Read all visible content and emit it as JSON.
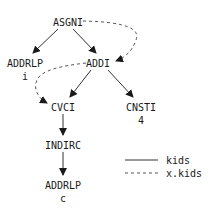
{
  "diagram": {
    "nodes": [
      {
        "id": "asgni",
        "label": "ASGNI",
        "sub": ""
      },
      {
        "id": "addrlp-i",
        "label": "ADDRLP",
        "sub": "i"
      },
      {
        "id": "addi",
        "label": "ADDI",
        "sub": ""
      },
      {
        "id": "cvci",
        "label": "CVCI",
        "sub": ""
      },
      {
        "id": "cnsti",
        "label": "CNSTI",
        "sub": "4"
      },
      {
        "id": "indirc",
        "label": "INDIRC",
        "sub": ""
      },
      {
        "id": "addrlp-c",
        "label": "ADDRLP",
        "sub": "c"
      }
    ],
    "edges": [
      {
        "from": "asgni",
        "to": "addrlp-i",
        "style": "solid"
      },
      {
        "from": "asgni",
        "to": "addi",
        "style": "solid"
      },
      {
        "from": "addi",
        "to": "cvci",
        "style": "solid"
      },
      {
        "from": "addi",
        "to": "cnsti",
        "style": "solid"
      },
      {
        "from": "cvci",
        "to": "indirc",
        "style": "solid"
      },
      {
        "from": "indirc",
        "to": "addrlp-c",
        "style": "solid"
      },
      {
        "from": "asgni",
        "to": "addi",
        "style": "dashed"
      },
      {
        "from": "addi",
        "to": "cvci",
        "style": "dashed"
      }
    ],
    "legend": [
      {
        "style": "solid",
        "label": "kids"
      },
      {
        "style": "dashed",
        "label": "x.kids"
      }
    ]
  }
}
